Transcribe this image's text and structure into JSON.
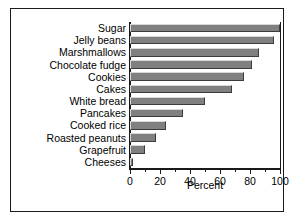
{
  "chart_data": {
    "type": "bar",
    "orientation": "horizontal",
    "title": "",
    "subtitle": "",
    "xlabel": "Percent",
    "ylabel": "",
    "categories": [
      "Sugar",
      "Jelly beans",
      "Marshmallows",
      "Chocolate fudge",
      "Cookies",
      "Cakes",
      "White bread",
      "Pancakes",
      "Cooked rice",
      "Roasted peanuts",
      "Grapefruit",
      "Cheeses"
    ],
    "values": [
      100,
      96,
      86,
      81,
      76,
      68,
      50,
      35,
      24,
      17,
      10,
      2
    ],
    "xlim": [
      0,
      100
    ],
    "xticks": [
      0,
      20,
      40,
      60,
      80,
      100
    ],
    "xtick_labels": [
      "0",
      "20",
      "40",
      "60",
      "80",
      "100"
    ],
    "xminor_ticks": [
      10,
      30,
      50,
      70,
      90
    ],
    "grid": false,
    "legend": null,
    "legend_position": "none",
    "bar_color": "#808080",
    "bar_edge_light": "#d8d8d8",
    "bar_edge_dark": "#3c3c3c",
    "axis_color": "#1a1a1a",
    "background_color": "#ffffff",
    "frame_color": "#1a1a1a"
  }
}
